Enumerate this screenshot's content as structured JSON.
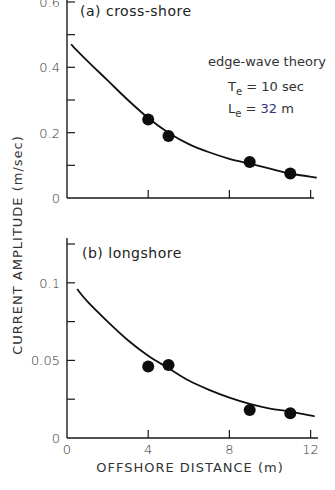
{
  "chart_data": [
    {
      "type": "scatter",
      "panel_label": "(a) cross-shore",
      "annotation": {
        "line1": "edge-wave theory",
        "line2": "Te = 10 sec",
        "line3": "Le = 32 m"
      },
      "xlabel": "OFFSHORE DISTANCE (m)",
      "ylabel": "CURRENT AMPLITUDE (m/sec)",
      "xlim": [
        0,
        12
      ],
      "ylim": [
        0,
        0.6
      ],
      "xticks": [
        0,
        4,
        8,
        12
      ],
      "yticks": [
        0,
        0.1,
        0.2,
        0.3,
        0.4,
        0.5,
        0.6
      ],
      "ytick_labels": [
        "0",
        "",
        "0.2",
        "",
        "0.4",
        "",
        "0.6"
      ],
      "series": [
        {
          "name": "observed",
          "kind": "points",
          "x": [
            4,
            5,
            9,
            11
          ],
          "y": [
            0.24,
            0.19,
            0.11,
            0.075
          ]
        },
        {
          "name": "edge-wave theory",
          "kind": "line",
          "x": [
            0.2,
            1,
            2,
            3,
            4,
            5,
            6,
            7,
            8,
            9,
            10,
            11,
            12.3
          ],
          "y": [
            0.47,
            0.42,
            0.36,
            0.3,
            0.245,
            0.2,
            0.165,
            0.14,
            0.12,
            0.105,
            0.09,
            0.075,
            0.062
          ]
        }
      ]
    },
    {
      "type": "scatter",
      "panel_label": "(b) longshore",
      "xlabel": "OFFSHORE DISTANCE (m)",
      "ylabel": "CURRENT AMPLITUDE (m/sec)",
      "xlim": [
        0,
        12
      ],
      "ylim": [
        0,
        0.125
      ],
      "xticks": [
        0,
        4,
        8,
        12
      ],
      "xtick_labels": [
        "0",
        "4",
        "8",
        "12"
      ],
      "yticks": [
        0,
        0.025,
        0.05,
        0.075,
        0.1,
        0.125
      ],
      "ytick_labels": [
        "0",
        "",
        "0.05",
        "",
        "0.1",
        ""
      ],
      "series": [
        {
          "name": "observed",
          "kind": "points",
          "x": [
            4,
            5,
            9,
            11
          ],
          "y": [
            0.046,
            0.047,
            0.018,
            0.016
          ]
        },
        {
          "name": "edge-wave theory",
          "kind": "line",
          "x": [
            0.5,
            1,
            2,
            3,
            4,
            5,
            6,
            7,
            8,
            9,
            10,
            11,
            12.2
          ],
          "y": [
            0.096,
            0.088,
            0.075,
            0.063,
            0.053,
            0.045,
            0.037,
            0.031,
            0.026,
            0.022,
            0.019,
            0.017,
            0.014
          ]
        }
      ]
    }
  ]
}
